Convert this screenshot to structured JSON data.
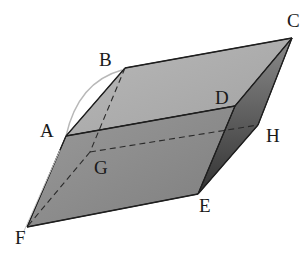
{
  "diagram": {
    "vertices": {
      "A": {
        "label": "A",
        "x": 66,
        "y": 136,
        "lx": 40,
        "ly": 137
      },
      "B": {
        "label": "B",
        "x": 125,
        "y": 68,
        "lx": 99,
        "ly": 66
      },
      "C": {
        "label": "C",
        "x": 292,
        "y": 38,
        "lx": 287,
        "ly": 27
      },
      "D": {
        "label": "D",
        "x": 235,
        "y": 106,
        "lx": 215,
        "ly": 104
      },
      "G": {
        "label": "G",
        "x": 90,
        "y": 152,
        "lx": 94,
        "ly": 174
      },
      "H": {
        "label": "H",
        "x": 258,
        "y": 125,
        "lx": 266,
        "ly": 142
      },
      "E": {
        "label": "E",
        "x": 198,
        "y": 194,
        "lx": 199,
        "ly": 212
      },
      "F": {
        "label": "F",
        "x": 27,
        "y": 227,
        "lx": 15,
        "ly": 244
      }
    },
    "faces": {
      "top": {
        "name": "ABCD",
        "color": "#a9a9a9"
      },
      "front": {
        "name": "ADEF",
        "color": "#8a8a8a"
      },
      "right": {
        "name": "DCHE",
        "color": "#5e5e5e"
      }
    },
    "hidden_edges": [
      "BG",
      "GH",
      "GF"
    ],
    "colors": {
      "edge": "#222222",
      "hidden_edge": "#333333",
      "arc": "#b0b0b0"
    }
  }
}
